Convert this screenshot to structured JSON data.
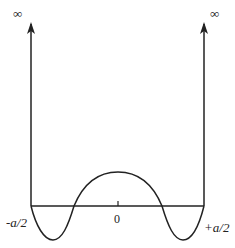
{
  "diagram": {
    "type": "potential-well-wavefunction",
    "labels": {
      "left_infinity": "∞",
      "right_infinity": "∞",
      "left_edge": "-a/2",
      "center": "0",
      "right_edge": "+a/2"
    },
    "colors": {
      "stroke": "#222222",
      "background": "#ffffff"
    }
  }
}
